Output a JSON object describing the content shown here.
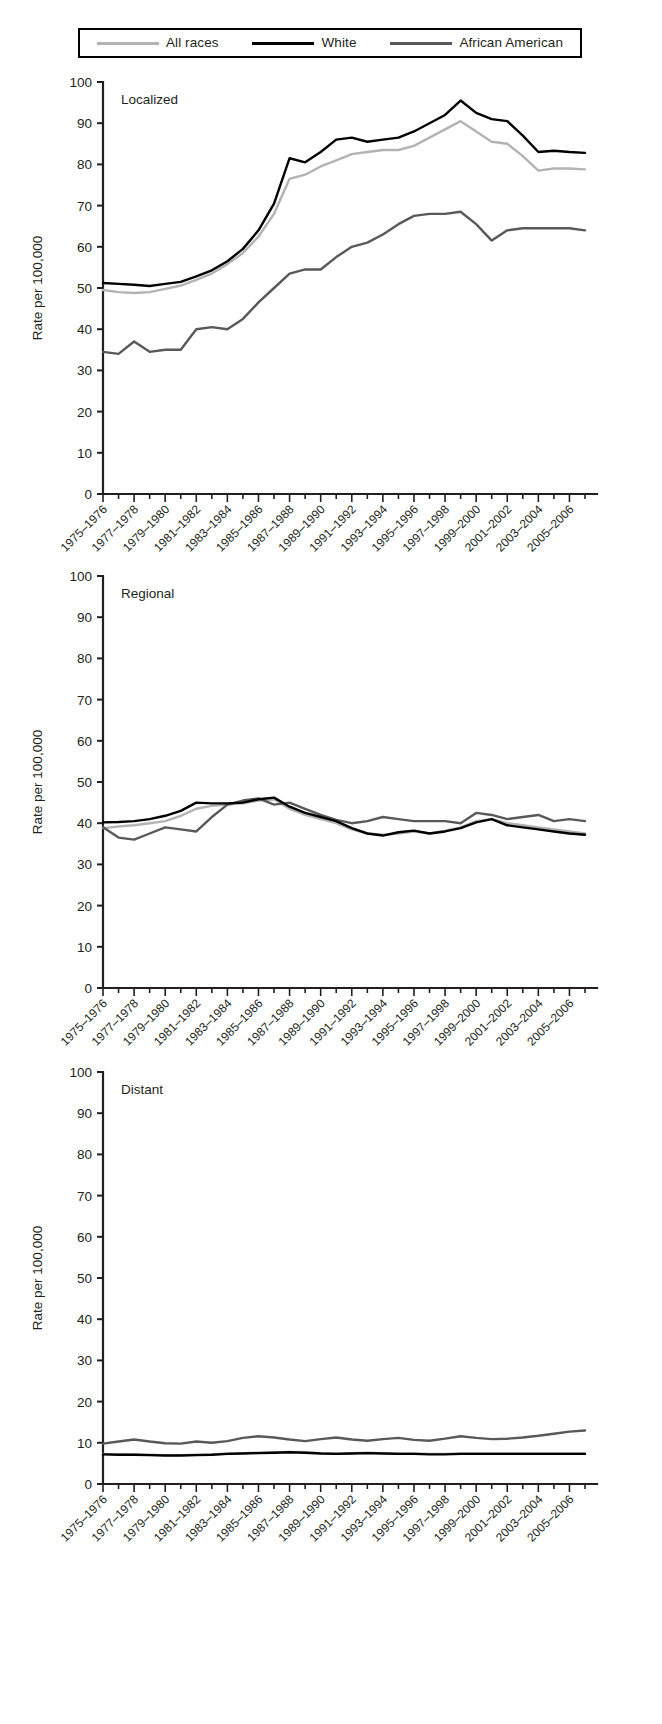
{
  "legend": {
    "items": [
      {
        "label": "All races",
        "color": "#b3b3b3",
        "width": 3
      },
      {
        "label": "White",
        "color": "#000000",
        "width": 3
      },
      {
        "label": "African American",
        "color": "#595959",
        "width": 3
      }
    ]
  },
  "axis": {
    "ylabel": "Rate per 100,000",
    "yticks": [
      "0",
      "10",
      "20",
      "30",
      "40",
      "50",
      "60",
      "70",
      "80",
      "90",
      "100"
    ],
    "xticks": [
      "1975–1976",
      "1977–1978",
      "1979–1980",
      "1981–1982",
      "1983–1984",
      "1985–1986",
      "1987–1988",
      "1989–1990",
      "1991–1992",
      "1993–1994",
      "1995–1996",
      "1997–1998",
      "1999–2000",
      "2001–2002",
      "2003–2004",
      "2005–2006"
    ]
  },
  "chart_data": [
    {
      "type": "line",
      "title": "Localized",
      "xlabel": "",
      "ylabel": "Rate per 100,000",
      "ylim": [
        0,
        100
      ],
      "grid": false,
      "legend_position": "top",
      "categories": [
        "1975–1976",
        "1977–1978",
        "1979–1980",
        "1981–1982",
        "1983–1984",
        "1985–1986",
        "1987–1988",
        "1989–1990",
        "1991–1992",
        "1993–1994",
        "1995–1996",
        "1997–1998",
        "1999–2000",
        "2001–2002",
        "2003–2004",
        "2005–2006"
      ],
      "x_years": [
        1975,
        1976,
        1977,
        1978,
        1979,
        1980,
        1981,
        1982,
        1983,
        1984,
        1985,
        1986,
        1987,
        1988,
        1989,
        1990,
        1991,
        1992,
        1993,
        1994,
        1995,
        1996,
        1997,
        1998,
        1999,
        2000,
        2001,
        2002,
        2003,
        2004,
        2005,
        2006
      ],
      "series": [
        {
          "name": "All races",
          "color": "#b3b3b3",
          "values": [
            49.5,
            49.0,
            48.8,
            49.0,
            49.8,
            50.6,
            52.0,
            53.5,
            55.8,
            58.5,
            62.5,
            68.0,
            76.5,
            77.5,
            79.5,
            81.0,
            82.5,
            83.0,
            83.5,
            83.5,
            84.5,
            86.5,
            88.5,
            90.5,
            88.0,
            85.5,
            85.0,
            82.0,
            78.5,
            79.0,
            79.0,
            78.8
          ]
        },
        {
          "name": "White",
          "color": "#000000",
          "values": [
            51.2,
            51.0,
            50.8,
            50.5,
            51.0,
            51.5,
            52.8,
            54.3,
            56.5,
            59.5,
            64.0,
            70.5,
            81.5,
            80.5,
            83.0,
            86.0,
            86.5,
            85.5,
            86.0,
            86.5,
            88.0,
            90.0,
            92.0,
            95.5,
            92.5,
            91.0,
            90.5,
            87.0,
            83.0,
            83.3,
            83.0,
            82.8
          ]
        },
        {
          "name": "African American",
          "color": "#595959",
          "values": [
            34.5,
            34.0,
            37.0,
            34.5,
            35.0,
            35.0,
            40.0,
            40.5,
            40.0,
            42.5,
            46.5,
            50.0,
            53.5,
            54.5,
            54.5,
            57.5,
            60.0,
            61.0,
            63.0,
            65.5,
            67.5,
            68.0,
            68.0,
            68.5,
            65.5,
            61.5,
            64.0,
            64.5,
            64.5,
            64.5,
            64.5,
            64.0
          ]
        }
      ]
    },
    {
      "type": "line",
      "title": "Regional",
      "xlabel": "",
      "ylabel": "Rate per 100,000",
      "ylim": [
        0,
        100
      ],
      "grid": false,
      "legend_position": "top",
      "categories": [
        "1975–1976",
        "1977–1978",
        "1979–1980",
        "1981–1982",
        "1983–1984",
        "1985–1986",
        "1987–1988",
        "1989–1990",
        "1991–1992",
        "1993–1994",
        "1995–1996",
        "1997–1998",
        "1999–2000",
        "2001–2002",
        "2003–2004",
        "2005–2006"
      ],
      "x_years": [
        1975,
        1976,
        1977,
        1978,
        1979,
        1980,
        1981,
        1982,
        1983,
        1984,
        1985,
        1986,
        1987,
        1988,
        1989,
        1990,
        1991,
        1992,
        1993,
        1994,
        1995,
        1996,
        1997,
        1998,
        1999,
        2000,
        2001,
        2002,
        2003,
        2004,
        2005,
        2006
      ],
      "series": [
        {
          "name": "All races",
          "color": "#b3b3b3",
          "values": [
            38.8,
            39.2,
            39.5,
            40.0,
            40.5,
            41.8,
            43.5,
            44.2,
            44.5,
            44.8,
            45.5,
            45.8,
            43.5,
            42.0,
            41.0,
            40.0,
            38.5,
            37.5,
            37.2,
            37.5,
            38.0,
            37.5,
            38.2,
            39.0,
            40.5,
            41.0,
            40.0,
            39.5,
            39.0,
            38.5,
            38.0,
            37.5
          ]
        },
        {
          "name": "White",
          "color": "#000000",
          "values": [
            40.2,
            40.3,
            40.5,
            41.0,
            41.8,
            43.0,
            45.0,
            44.8,
            44.8,
            45.0,
            45.8,
            46.2,
            44.0,
            42.5,
            41.5,
            40.5,
            38.8,
            37.5,
            37.0,
            37.8,
            38.2,
            37.5,
            38.0,
            38.8,
            40.2,
            41.0,
            39.5,
            39.0,
            38.5,
            38.0,
            37.5,
            37.2
          ]
        },
        {
          "name": "African American",
          "color": "#595959",
          "values": [
            39.0,
            36.5,
            36.0,
            37.5,
            39.0,
            38.5,
            38.0,
            41.5,
            44.5,
            45.5,
            46.0,
            44.5,
            45.0,
            43.5,
            42.0,
            40.8,
            40.0,
            40.5,
            41.5,
            41.0,
            40.5,
            40.5,
            40.5,
            40.0,
            42.5,
            42.0,
            41.0,
            41.5,
            42.0,
            40.5,
            41.0,
            40.5
          ]
        }
      ]
    },
    {
      "type": "line",
      "title": "Distant",
      "xlabel": "",
      "ylabel": "Rate per 100,000",
      "ylim": [
        0,
        100
      ],
      "grid": false,
      "legend_position": "top",
      "categories": [
        "1975–1976",
        "1977–1978",
        "1979–1980",
        "1981–1982",
        "1983–1984",
        "1985–1986",
        "1987–1988",
        "1989–1990",
        "1991–1992",
        "1993–1994",
        "1995–1996",
        "1997–1998",
        "1999–2000",
        "2001–2002",
        "2003–2004",
        "2005–2006"
      ],
      "x_years": [
        1975,
        1976,
        1977,
        1978,
        1979,
        1980,
        1981,
        1982,
        1983,
        1984,
        1985,
        1986,
        1987,
        1988,
        1989,
        1990,
        1991,
        1992,
        1993,
        1994,
        1995,
        1996,
        1997,
        1998,
        1999,
        2000,
        2001,
        2002,
        2003,
        2004,
        2005,
        2006
      ],
      "series": [
        {
          "name": "All races",
          "color": "#b3b3b3",
          "values": [
            7.3,
            7.2,
            7.2,
            7.1,
            7.0,
            7.0,
            7.1,
            7.2,
            7.4,
            7.5,
            7.6,
            7.7,
            7.8,
            7.7,
            7.5,
            7.4,
            7.5,
            7.6,
            7.5,
            7.4,
            7.4,
            7.3,
            7.3,
            7.4,
            7.4,
            7.4,
            7.4,
            7.4,
            7.4,
            7.4,
            7.4,
            7.4
          ]
        },
        {
          "name": "White",
          "color": "#000000",
          "values": [
            7.2,
            7.1,
            7.1,
            7.0,
            6.9,
            6.9,
            7.0,
            7.1,
            7.3,
            7.4,
            7.5,
            7.6,
            7.7,
            7.6,
            7.4,
            7.3,
            7.4,
            7.5,
            7.4,
            7.3,
            7.3,
            7.2,
            7.2,
            7.3,
            7.3,
            7.3,
            7.3,
            7.3,
            7.3,
            7.3,
            7.3,
            7.3
          ]
        },
        {
          "name": "African American",
          "color": "#595959",
          "values": [
            9.8,
            10.3,
            10.8,
            10.3,
            9.9,
            9.8,
            10.3,
            10.0,
            10.4,
            11.2,
            11.6,
            11.3,
            10.8,
            10.4,
            10.9,
            11.3,
            10.8,
            10.5,
            10.9,
            11.2,
            10.7,
            10.5,
            11.0,
            11.6,
            11.2,
            10.9,
            11.0,
            11.3,
            11.7,
            12.2,
            12.7,
            13.0
          ]
        }
      ]
    }
  ]
}
